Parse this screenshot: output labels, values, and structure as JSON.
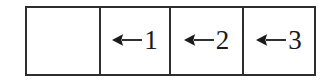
{
  "diagram": {
    "type": "partitioned-strip",
    "shape": "rectangle",
    "cell_count": 4,
    "border_color": "#2e2e2e",
    "fill_color": "#ffffff",
    "text_color": "#1a1a1a",
    "cells": [
      {
        "index": 0,
        "label": "",
        "arrow": "",
        "arrow_icon": "arrow-left-icon",
        "empty": true
      },
      {
        "index": 1,
        "label": "1",
        "arrow": "←",
        "arrow_icon": "arrow-left-icon",
        "empty": false
      },
      {
        "index": 2,
        "label": "2",
        "arrow": "←",
        "arrow_icon": "arrow-left-icon",
        "empty": false
      },
      {
        "index": 3,
        "label": "3",
        "arrow": "←",
        "arrow_icon": "arrow-left-icon",
        "empty": false
      }
    ]
  }
}
